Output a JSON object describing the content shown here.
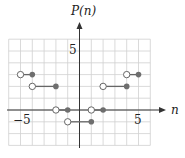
{
  "chart_data": {
    "type": "line",
    "title": "",
    "xlabel": "n",
    "ylabel": "P(n)",
    "xlim": [
      -6,
      6
    ],
    "ylim": [
      -3,
      6
    ],
    "grid": true,
    "x_tick_labels": [
      {
        "value": -5,
        "label": "−5"
      },
      {
        "value": 5,
        "label": "5"
      }
    ],
    "y_tick_labels": [
      {
        "value": 5,
        "label": "5"
      }
    ],
    "segments": [
      {
        "x_start": -5,
        "x_end": -4,
        "y": 3,
        "start": "open",
        "end": "closed"
      },
      {
        "x_start": -4,
        "x_end": -2,
        "y": 2,
        "start": "open",
        "end": "closed"
      },
      {
        "x_start": -2,
        "x_end": -1,
        "y": 0,
        "start": "open",
        "end": "closed"
      },
      {
        "x_start": -1,
        "x_end": 1,
        "y": -1,
        "start": "open",
        "end": "closed"
      },
      {
        "x_start": 1,
        "x_end": 2,
        "y": 0,
        "start": "open",
        "end": "closed"
      },
      {
        "x_start": 2,
        "x_end": 4,
        "y": 2,
        "start": "open",
        "end": "closed"
      },
      {
        "x_start": 4,
        "x_end": 5,
        "y": 3,
        "start": "open",
        "end": "closed"
      }
    ],
    "colors": {
      "grid": "#d0d0d0",
      "axis": "#333333",
      "segment": "#666666",
      "closed_dot": "#6e6e6e",
      "open_dot_stroke": "#666666",
      "open_dot_fill": "#ffffff"
    }
  },
  "labels": {
    "y_axis_label": "P(n)",
    "x_axis_label": "n",
    "x_tick_neg5": "−5",
    "x_tick_5": "5",
    "y_tick_5": "5"
  }
}
